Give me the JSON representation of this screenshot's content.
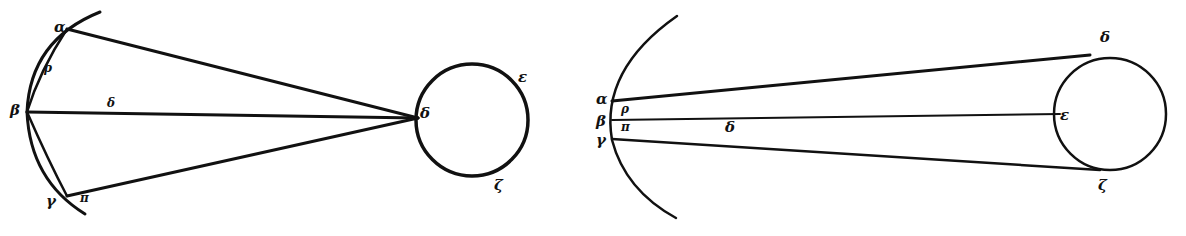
{
  "diagram": {
    "type": "geometric-optics-figure",
    "ink_color": "#111111",
    "background": "#ffffff",
    "figure_left": {
      "arc_labels": {
        "top": "α",
        "middle": "β",
        "bottom": "γ"
      },
      "inner_labels": {
        "upper_lens": "ρ",
        "center_line": "δ",
        "lower": "π"
      },
      "circle_labels": {
        "left": "δ",
        "upper_right": "ε",
        "bottom": "ζ"
      }
    },
    "figure_right": {
      "arc_labels": {
        "top": "α",
        "middle": "β",
        "bottom": "γ"
      },
      "inner_labels": {
        "upper": "ρ",
        "lower": "π",
        "crossing": "δ"
      },
      "circle_labels": {
        "top": "δ",
        "left": "ε",
        "bottom": "ζ"
      }
    }
  }
}
